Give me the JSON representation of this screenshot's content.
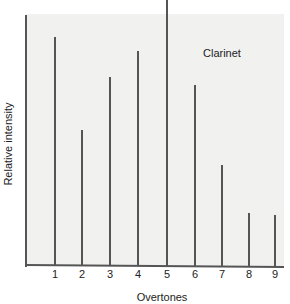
{
  "chart_data": {
    "type": "bar",
    "title": "",
    "series_label": "Clarinet",
    "xlabel": "Overtones",
    "ylabel": "Relative intensity",
    "categories": [
      "1",
      "2",
      "3",
      "4",
      "5",
      "6",
      "7",
      "8",
      "9"
    ],
    "values": [
      86,
      51,
      71,
      81,
      100,
      68,
      38,
      20,
      19
    ],
    "ylim": [
      0,
      100
    ],
    "grid": false,
    "style": "stem lines",
    "colors": {
      "background_panel": "#f1f1f0",
      "lines": "#555555",
      "text": "#222222"
    }
  }
}
